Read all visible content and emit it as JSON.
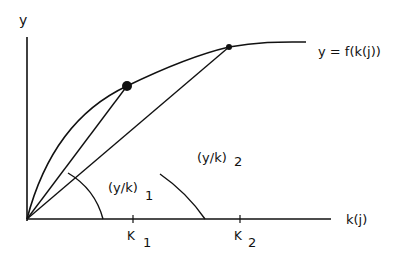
{
  "diagram": {
    "y_axis_label": "y",
    "x_axis_label": "k(j)",
    "curve_label": "y = f(k(j))",
    "angle_labels": [
      {
        "text": "(y/k)",
        "sub": "1"
      },
      {
        "text": "(y/k)",
        "sub": "2"
      }
    ],
    "ticks": [
      {
        "text": "K",
        "sub": "1"
      },
      {
        "text": "K",
        "sub": "2"
      }
    ],
    "points": [
      {
        "name": "point-1",
        "size": "large"
      },
      {
        "name": "point-2",
        "size": "small"
      }
    ],
    "colors": {
      "line": "#111111",
      "background": "#ffffff"
    }
  }
}
